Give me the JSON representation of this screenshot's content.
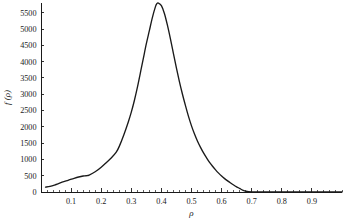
{
  "chart_data": {
    "type": "line",
    "title": "",
    "subtitle": "",
    "xlabel": "ρ",
    "ylabel": "f (ρ)",
    "xlim": [
      0.0,
      1.0
    ],
    "ylim": [
      0,
      5800
    ],
    "grid": false,
    "legend": null,
    "legend_position": "none",
    "x_ticks": [
      0.1,
      0.2,
      0.3,
      0.4,
      0.5,
      0.6,
      0.7,
      0.8,
      0.9
    ],
    "x_tick_labels": [
      "0.1",
      "0.2",
      "0.3",
      "0.4",
      "0.5",
      "0.6",
      "0.7",
      "0.8",
      "0.9"
    ],
    "x_minor_tick_step": 0.02,
    "y_ticks": [
      0,
      500,
      1000,
      1500,
      2000,
      2500,
      3000,
      3500,
      4000,
      4500,
      5000,
      5500
    ],
    "y_tick_labels": [
      "0",
      "500",
      "1000",
      "1500",
      "2000",
      "2500",
      "3000",
      "3500",
      "4000",
      "4500",
      "5000",
      "5500"
    ],
    "series": [
      {
        "name": "f(ρ)",
        "color": "#1a1a1a",
        "x": [
          0.015,
          0.03,
          0.05,
          0.07,
          0.09,
          0.11,
          0.125,
          0.14,
          0.15,
          0.16,
          0.18,
          0.2,
          0.22,
          0.235,
          0.25,
          0.26,
          0.275,
          0.29,
          0.3,
          0.31,
          0.32,
          0.33,
          0.34,
          0.35,
          0.36,
          0.37,
          0.38,
          0.385,
          0.39,
          0.4,
          0.41,
          0.42,
          0.43,
          0.44,
          0.45,
          0.46,
          0.47,
          0.48,
          0.49,
          0.5,
          0.51,
          0.52,
          0.53,
          0.54,
          0.55,
          0.56,
          0.57,
          0.58,
          0.59,
          0.6,
          0.61,
          0.62,
          0.63,
          0.64,
          0.65,
          0.66,
          0.67,
          0.68,
          0.7,
          0.75,
          0.8,
          0.9,
          1.0
        ],
        "y": [
          150,
          170,
          230,
          300,
          360,
          420,
          460,
          490,
          500,
          520,
          620,
          760,
          930,
          1060,
          1220,
          1400,
          1750,
          2150,
          2450,
          2800,
          3200,
          3650,
          4100,
          4550,
          4950,
          5350,
          5680,
          5780,
          5800,
          5720,
          5480,
          5120,
          4700,
          4250,
          3800,
          3380,
          3000,
          2650,
          2320,
          2030,
          1780,
          1560,
          1370,
          1200,
          1050,
          910,
          790,
          680,
          580,
          490,
          410,
          340,
          275,
          215,
          160,
          110,
          60,
          25,
          5,
          0,
          0,
          0,
          0
        ]
      }
    ]
  },
  "axis": {
    "y_title": "f (ρ)",
    "x_title": "ρ"
  },
  "caption": {
    "text": ""
  }
}
